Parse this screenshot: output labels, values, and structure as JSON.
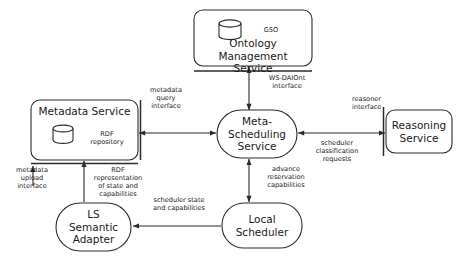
{
  "diagram": {
    "type": "architecture-block-diagram",
    "nodes": [
      {
        "id": "ontology-management-service",
        "label": "Ontology Management\nService",
        "shape": "rounded-rectangle",
        "store_icon": "cylinder",
        "store_label": "GSO",
        "x": 194,
        "y": 10,
        "w": 118,
        "h": 56
      },
      {
        "id": "metadata-service",
        "label": "Metadata Service",
        "shape": "rounded-rectangle",
        "store_icon": "cylinder",
        "store_label": "RDF\nrepository",
        "x": 31,
        "y": 100,
        "w": 107,
        "h": 60
      },
      {
        "id": "meta-scheduling-service",
        "label": "Meta-\nScheduling\nService",
        "shape": "stadium",
        "x": 217,
        "y": 110,
        "w": 80,
        "h": 48
      },
      {
        "id": "reasoning-service",
        "label": "Reasoning\nService",
        "shape": "rounded-rectangle",
        "x": 386,
        "y": 110,
        "w": 66,
        "h": 43
      },
      {
        "id": "ls-semantic-adapter",
        "label": "LS\nSemantic\nAdapter",
        "shape": "stadium",
        "x": 56,
        "y": 203,
        "w": 75,
        "h": 48
      },
      {
        "id": "local-scheduler",
        "label": "Local\nScheduler",
        "shape": "stadium",
        "x": 222,
        "y": 203,
        "w": 80,
        "h": 45
      }
    ],
    "edges": [
      {
        "id": "ws-daiont",
        "from": "meta-scheduling-service",
        "to": "ontology-management-service",
        "arrow": "both",
        "label": "WS-DAIOnt\ninterface",
        "label_align": "center",
        "label_x": 281,
        "label_y": 72,
        "interface_bar": "horizontal"
      },
      {
        "id": "metadata-query",
        "from": "metadata-service",
        "to": "meta-scheduling-service",
        "arrow": "both",
        "label": "metadata\nquery\ninterface",
        "label_align": "center",
        "label_x": 141,
        "label_y": 86,
        "interface_bar": "vertical"
      },
      {
        "id": "reasoner-interface",
        "from": "meta-scheduling-service",
        "to": "reasoning-service",
        "arrow": "both",
        "label": "reasoner\ninterface",
        "label_align": "left",
        "label_x": 352,
        "label_y": 95,
        "interface_bar": "vertical"
      },
      {
        "id": "scheduler-classification",
        "from": "reasoning-service",
        "to": "meta-scheduling-service",
        "arrow": "both",
        "label": "scheduler\nclassification\nrequests",
        "label_align": "center",
        "label_x": 310,
        "label_y": 139
      },
      {
        "id": "advance-reservation",
        "from": "local-scheduler",
        "to": "meta-scheduling-service",
        "arrow": "both",
        "label": "advance\nreservation\ncapabilities",
        "label_align": "center",
        "label_x": 264,
        "label_y": 165
      },
      {
        "id": "scheduler-state",
        "from": "local-scheduler",
        "to": "ls-semantic-adapter",
        "arrow": "to",
        "label": "scheduler state\nand capabilities",
        "label_align": "center",
        "label_x": 150,
        "label_y": 196
      },
      {
        "id": "rdf-representation",
        "from": "ls-semantic-adapter",
        "to": "metadata-service",
        "arrow": "to",
        "label": "RDF\nrepresentation\nof state and\ncapabilities",
        "label_align": "center",
        "label_x": 84,
        "label_y": 163,
        "interface_bar": "horizontal"
      },
      {
        "id": "metadata-upload",
        "from": "ls-semantic-adapter",
        "to": "metadata-service",
        "arrow": "none",
        "label": "metadata\nupload\ninterface",
        "label_align": "center",
        "label_x": 12,
        "label_y": 163
      }
    ],
    "colors": {
      "stroke": "#2b2b2b",
      "background": "#ffffff",
      "text": "#1a1a1a"
    }
  }
}
